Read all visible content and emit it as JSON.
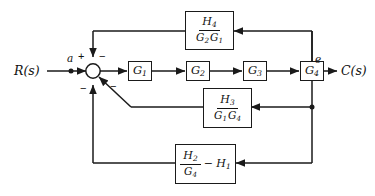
{
  "diagram": {
    "type": "control-system-block-diagram",
    "stroke_color": "#1a1a1a",
    "background": "#ffffff"
  },
  "signals": {
    "input_label": "R(s)",
    "output_label": "C(s)",
    "node_a": "a",
    "node_e": "e"
  },
  "summing_junction": {
    "name": "summing-junction",
    "signs": {
      "input_left": "+",
      "feedback_top": "−",
      "feedback_diagonal": "−",
      "feedback_bottom": "−"
    }
  },
  "forward_path": [
    {
      "id": "G1",
      "label_main": "G",
      "label_sub": "1"
    },
    {
      "id": "G2",
      "label_main": "G",
      "label_sub": "2"
    },
    {
      "id": "G3",
      "label_main": "G",
      "label_sub": "3"
    },
    {
      "id": "G4",
      "label_main": "G",
      "label_sub": "4"
    }
  ],
  "feedback_blocks": {
    "top": {
      "id": "H4-over-G2G1",
      "numerator_main": "H",
      "numerator_sub": "4",
      "denominator": [
        {
          "main": "G",
          "sub": "2"
        },
        {
          "main": "G",
          "sub": "1"
        }
      ]
    },
    "middle": {
      "id": "H3-over-G1G4",
      "numerator_main": "H",
      "numerator_sub": "3",
      "denominator": [
        {
          "main": "G",
          "sub": "1"
        },
        {
          "main": "G",
          "sub": "4"
        }
      ]
    },
    "bottom": {
      "id": "H2-over-G4-minus-H1",
      "numerator_main": "H",
      "numerator_sub": "2",
      "denominator_main": "G",
      "denominator_sub": "4",
      "tail_operator": "−",
      "tail_main": "H",
      "tail_sub": "1"
    }
  }
}
